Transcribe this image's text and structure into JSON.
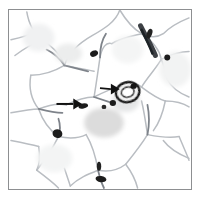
{
  "figure": {
    "kind": "histology-micrograph",
    "tissue": "adipose-like tissue with large polygonal cells",
    "stain_tone": "grayscale / desaturated brightfield",
    "frame": {
      "border_color": "#8d8f91",
      "border_width_px": 1,
      "left_px": 8,
      "top_px": 9,
      "width_px": 184,
      "height_px": 181,
      "background": "#ffffff"
    },
    "page_background": "#ffffff"
  },
  "palette": {
    "background": "#ffffff",
    "cell_wall_light": "#c9ccd0",
    "cell_wall_mid": "#8f9499",
    "cell_wall_dark": "#4a4e52",
    "nucleus_black": "#161616",
    "cytoplasm_gray": "#dcdcdc",
    "arrow_black": "#111111",
    "frame_gray": "#8d8f91"
  },
  "annotations": {
    "arrows": [
      {
        "id": "arrow-left",
        "label": "left-pointing-marker-arrow",
        "direction": "right",
        "tail_x": 57,
        "tail_y": 105,
        "tip_x": 83,
        "tip_y": 105,
        "color": "#111111",
        "shaft_thickness_px": 2,
        "head_length_px": 9,
        "head_width_px": 11,
        "points_to": "dark cell-wall junction / tri-cellular corner"
      },
      {
        "id": "arrow-right",
        "label": "upper-right-marker-arrow",
        "direction": "right",
        "tail_x": 101,
        "tail_y": 89,
        "tip_x": 121,
        "tip_y": 90,
        "color": "#111111",
        "shaft_thickness_px": 2,
        "head_length_px": 9,
        "head_width_px": 11,
        "points_to": "dark ring-shaped inclusion / stained organelle cluster"
      }
    ],
    "arrow_count": 2
  },
  "features": {
    "dark_nuclei": [
      {
        "id": "nucleus-top-mid",
        "cx": 94,
        "cy": 52,
        "rx": 4.2,
        "ry": 3.0,
        "rot": -25,
        "shade": "#1c1c1c"
      },
      {
        "id": "nucleus-top-right",
        "cx": 168,
        "cy": 56,
        "rx": 3.0,
        "ry": 3.0,
        "rot": 0,
        "shade": "#1b1b1b"
      },
      {
        "id": "nucleus-mid-left",
        "cx": 57,
        "cy": 133,
        "rx": 5.0,
        "ry": 4.4,
        "rot": 15,
        "shade": "#1a1a1a"
      },
      {
        "id": "nucleus-cluster-a",
        "cx": 113,
        "cy": 102,
        "rx": 3.2,
        "ry": 3.0,
        "rot": 0,
        "shade": "#1d1d1d"
      },
      {
        "id": "nucleus-cluster-b",
        "cx": 104,
        "cy": 106,
        "rx": 2.4,
        "ry": 2.2,
        "rot": 0,
        "shade": "#2a2a2a"
      },
      {
        "id": "nucleus-bottom-mid",
        "cx": 99,
        "cy": 166,
        "rx": 2.4,
        "ry": 4.6,
        "rot": 0,
        "shade": "#232323"
      },
      {
        "id": "nucleus-bottom-junction",
        "cx": 101,
        "cy": 179,
        "rx": 5.5,
        "ry": 3.2,
        "rot": 8,
        "shade": "#1f1f1f"
      },
      {
        "id": "nucleus-right-edge",
        "cx": 150,
        "cy": 32,
        "rx": 3.0,
        "ry": 6.0,
        "rot": 20,
        "shade": "#222222"
      }
    ],
    "ring_inclusion": {
      "id": "stained-ring-body",
      "cx": 128,
      "cy": 92,
      "outer_rx": 12,
      "outer_ry": 10,
      "inner_rx": 7,
      "inner_ry": 5.5,
      "rot": -15,
      "outline": "#1a1a1a",
      "fill": "#f2f2f2"
    },
    "gray_cell_blob": {
      "id": "dense-cytoplasm-cell",
      "cx": 102,
      "cy": 122,
      "rx": 20,
      "ry": 15,
      "fill": "#dcdcdc"
    },
    "thick_wall_band": {
      "id": "thickened-cell-wall-top-right",
      "from_x": 140,
      "from_y": 24,
      "to_x": 154,
      "to_y": 48,
      "color": "#3c4044",
      "width_px": 5
    },
    "cell_count_visible": 16
  }
}
